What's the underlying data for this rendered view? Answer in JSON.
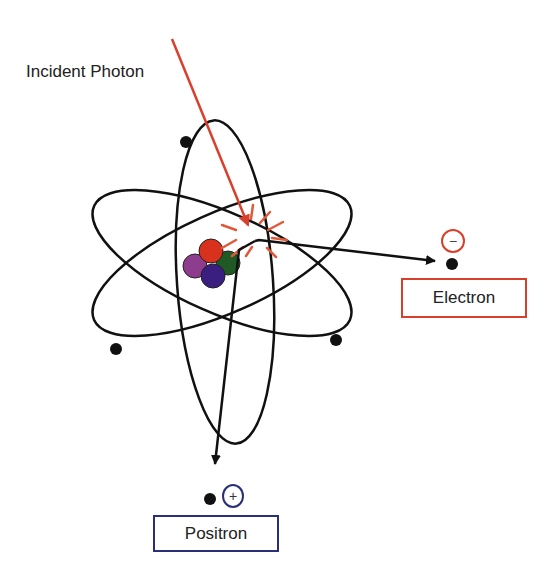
{
  "diagram": {
    "labels": {
      "incident_photon": "Incident Photon",
      "electron": "Electron",
      "positron": "Positron",
      "electron_charge": "−",
      "positron_charge": "+"
    },
    "colors": {
      "photon": "#d9402c",
      "electron_box": "#d9402c",
      "positron_box": "#2a2f7a",
      "orbit": "#111111",
      "nucleon_red": "#d8321f",
      "nucleon_green": "#1f5a25",
      "nucleon_purple": "#8e3d8e",
      "nucleon_blue": "#3a1f80"
    },
    "orbit_count": 3,
    "orbital_electron_count": 3,
    "nucleon_count": 4
  }
}
